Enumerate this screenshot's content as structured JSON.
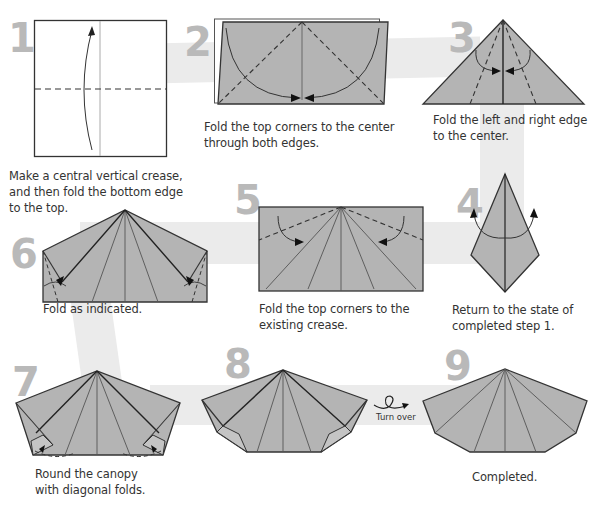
{
  "colors": {
    "paper": "#b4b4b4",
    "paper_light": "#c4c4c4",
    "outline": "#333333",
    "band": "#ebebeb",
    "step_number": "#b9b9b9",
    "text": "#333333"
  },
  "steps": [
    {
      "number": "1",
      "caption_lines": [
        "Make a central vertical crease,",
        "and then fold the bottom edge",
        "to the top."
      ],
      "diagram": "square-with-vertical-crease-and-fold-up-arrow"
    },
    {
      "number": "2",
      "caption_lines": [
        "Fold the top corners to the center",
        "through both edges."
      ],
      "diagram": "rectangle-with-diagonal-valley-folds"
    },
    {
      "number": "3",
      "caption_lines": [
        "Fold the left and right edge",
        "to the center."
      ],
      "diagram": "triangle-with-edge-folds"
    },
    {
      "number": "4",
      "caption_lines": [
        "Return to the state of",
        "completed step 1."
      ],
      "diagram": "kite-with-unfold-arrows"
    },
    {
      "number": "5",
      "caption_lines": [
        "Fold the top corners to the",
        "existing crease."
      ],
      "diagram": "rectangle-with-radiating-creases"
    },
    {
      "number": "6",
      "caption_lines": [
        "Fold as indicated."
      ],
      "diagram": "pentagon-house-shape-with-corner-folds"
    },
    {
      "number": "7",
      "caption_lines": [
        "Round the canopy",
        "with diagonal folds."
      ],
      "diagram": "pentagon-with-bottom-corner-folds"
    },
    {
      "number": "8",
      "caption_lines": [],
      "diagram": "rounded-canopy-front"
    },
    {
      "number": "9",
      "caption_lines": [
        "Completed."
      ],
      "diagram": "completed-canopy"
    }
  ],
  "turn_over": {
    "label": "Turn over",
    "icon": "turn-over-loop-arrow-icon"
  }
}
